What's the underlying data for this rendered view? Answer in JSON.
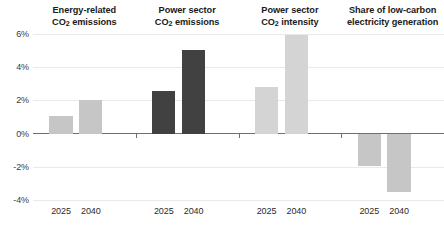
{
  "chart_data": {
    "type": "bar",
    "title": "",
    "subtitle": "",
    "xlabel": "",
    "ylabel": "",
    "ylim": [
      -4,
      6
    ],
    "yticks": [
      6,
      4,
      2,
      0,
      -2,
      -4
    ],
    "ytick_labels": [
      "6%",
      "4%",
      "2%",
      "0%",
      "-2%",
      "-4%"
    ],
    "grid": true,
    "legend_position": "none",
    "categories": [
      "2025",
      "2040"
    ],
    "panels": [
      {
        "title_line1": "Energy-related",
        "title_line2_pre": "CO",
        "title_line2_sub": "2",
        "title_line2_post": " emissions",
        "color": "#c6c6c6",
        "values": [
          1.05,
          2.05
        ],
        "bars": [
          {
            "category": "2025",
            "value": 1.05
          },
          {
            "category": "2040",
            "value": 2.05
          }
        ]
      },
      {
        "title_line1": "Power sector",
        "title_line2_pre": "CO",
        "title_line2_sub": "2",
        "title_line2_post": " emissions",
        "color": "#414141",
        "values": [
          2.55,
          5.05
        ],
        "bars": [
          {
            "category": "2025",
            "value": 2.55
          },
          {
            "category": "2040",
            "value": 5.05
          }
        ]
      },
      {
        "title_line1": "Power sector",
        "title_line2_pre": "CO",
        "title_line2_sub": "2",
        "title_line2_post": " intensity",
        "color": "#d4d4d4",
        "values": [
          2.8,
          5.95
        ],
        "bars": [
          {
            "category": "2025",
            "value": 2.8
          },
          {
            "category": "2040",
            "value": 5.95
          }
        ]
      },
      {
        "title_line1": "Share of low-carbon",
        "title_line2_pre": "electricity generation",
        "title_line2_sub": "",
        "title_line2_post": "",
        "color": "#c6c6c6",
        "values": [
          -1.95,
          -3.5
        ],
        "bars": [
          {
            "category": "2025",
            "value": -1.95
          },
          {
            "category": "2040",
            "value": -3.5
          }
        ]
      }
    ]
  }
}
